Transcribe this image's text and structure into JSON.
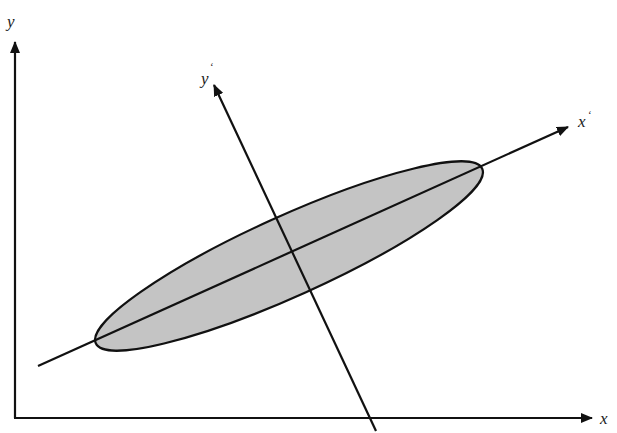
{
  "diagram": {
    "colors": {
      "line": "#111111",
      "ellipse_fill": "#c4c4c4",
      "ellipse_stroke": "#111111",
      "background": "#ffffff"
    },
    "axes": {
      "x": {
        "label": "x",
        "prime": ""
      },
      "y": {
        "label": "y",
        "prime": ""
      },
      "x_prime": {
        "label": "x",
        "prime": "‘"
      },
      "y_prime": {
        "label": "y",
        "prime": "‘"
      }
    },
    "ellipse": {
      "center": [
        289,
        256
      ],
      "rx": 212,
      "ry": 40,
      "rotation_deg": -24.3
    }
  }
}
